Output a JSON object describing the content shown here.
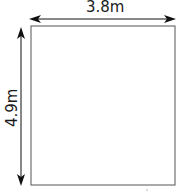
{
  "diagram": {
    "shape": "rectangle",
    "width_label": "3.8m",
    "height_label": "4.9m",
    "stroke_color": "#555555",
    "arrow_color": "#111111"
  }
}
